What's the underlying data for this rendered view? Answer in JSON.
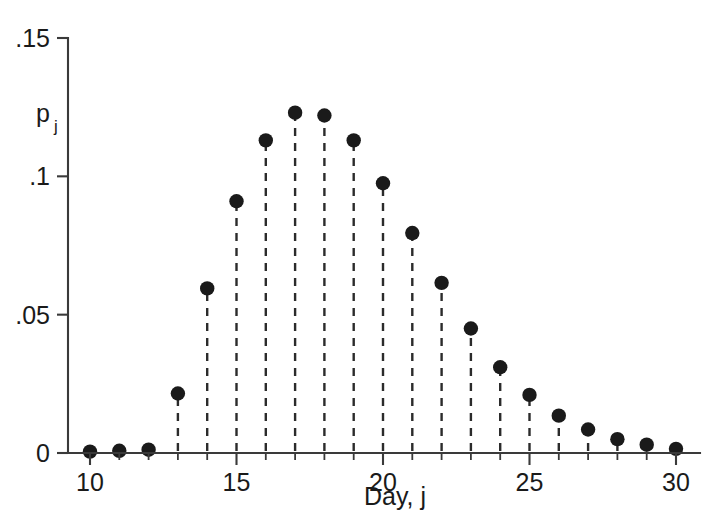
{
  "chart_data": {
    "type": "scatter",
    "title": "",
    "subtitle": "",
    "xlabel": "Day, j",
    "ylabel": "p",
    "ylabel_sub": "j",
    "xlim": [
      9.6,
      30.5
    ],
    "ylim": [
      0,
      0.152
    ],
    "grid": false,
    "legend": null,
    "marker_style": "filled-circle",
    "stem_style": "dashed-vertical",
    "x_ticks": [
      10,
      15,
      20,
      25,
      30
    ],
    "x_tick_labels": [
      "10",
      "15",
      "20",
      "25",
      "30"
    ],
    "x_minor_ticks": [
      11,
      12,
      13,
      14,
      16,
      17,
      18,
      19,
      21,
      22,
      23,
      24,
      26,
      27,
      28,
      29
    ],
    "y_ticks": [
      0,
      0.05,
      0.1,
      0.15
    ],
    "y_tick_labels": [
      "0",
      ".05",
      ".1",
      ".15"
    ],
    "x": [
      10,
      11,
      12,
      13,
      14,
      15,
      16,
      17,
      18,
      19,
      20,
      21,
      22,
      23,
      24,
      25,
      26,
      27,
      28,
      29,
      30
    ],
    "values": [
      0.0005,
      0.0008,
      0.0012,
      0.0215,
      0.0595,
      0.091,
      0.113,
      0.123,
      0.122,
      0.113,
      0.0975,
      0.0795,
      0.0615,
      0.045,
      0.031,
      0.021,
      0.0135,
      0.0085,
      0.005,
      0.003,
      0.0015
    ],
    "categories": [
      "10",
      "11",
      "12",
      "13",
      "14",
      "15",
      "16",
      "17",
      "18",
      "19",
      "20",
      "21",
      "22",
      "23",
      "24",
      "25",
      "26",
      "27",
      "28",
      "29",
      "30"
    ],
    "colors": {
      "marker": "#1a1a1a",
      "stem": "#2b2b2b",
      "axis": "#3a3a3a",
      "background": "#ffffff"
    }
  },
  "figure": {
    "background_color": "#ffffff"
  }
}
